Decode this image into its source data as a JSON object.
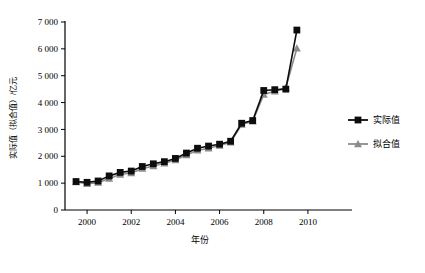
{
  "chart_data": {
    "type": "line",
    "title": "",
    "xlabel": "年份",
    "ylabel": "实际值（拟合值）/亿元",
    "xlim": [
      1999,
      2011
    ],
    "ylim": [
      0,
      7000
    ],
    "grid": false,
    "legend_position": "right",
    "x_ticks": [
      "2000",
      "2002",
      "2004",
      "2006",
      "2008",
      "2010"
    ],
    "x_tick_values": [
      2000,
      2002,
      2004,
      2006,
      2008,
      2010
    ],
    "y_ticks": [
      "0",
      "1 000",
      "2 000",
      "3 000",
      "4 000",
      "5 000",
      "6 000",
      "7 000"
    ],
    "y_tick_values": [
      0,
      1000,
      2000,
      3000,
      4000,
      5000,
      6000,
      7000
    ],
    "x": [
      1999.5,
      2000.0,
      2000.5,
      2001.0,
      2001.5,
      2002.0,
      2002.5,
      2003.0,
      2003.5,
      2004.0,
      2004.5,
      2005.0,
      2005.5,
      2006.0,
      2006.5,
      2007.0,
      2007.5,
      2008.0,
      2008.5,
      2009.0,
      2009.5
    ],
    "series": [
      {
        "name": "实际值",
        "color": "#0d0d0d",
        "marker": "square",
        "values": [
          1060,
          1030,
          1080,
          1270,
          1400,
          1450,
          1620,
          1720,
          1800,
          1920,
          2120,
          2300,
          2380,
          2450,
          2560,
          3230,
          3330,
          4450,
          4480,
          4500,
          6700
        ]
      },
      {
        "name": "拟合值",
        "color": "#8c8c8c",
        "marker": "triangle",
        "values": [
          1040,
          980,
          1020,
          1170,
          1320,
          1380,
          1540,
          1640,
          1740,
          1860,
          2050,
          2220,
          2300,
          2400,
          2520,
          3180,
          3300,
          4300,
          4420,
          4560,
          6020
        ]
      }
    ]
  },
  "legend": {
    "items": [
      {
        "label": "实际值"
      },
      {
        "label": "拟合值"
      }
    ]
  }
}
